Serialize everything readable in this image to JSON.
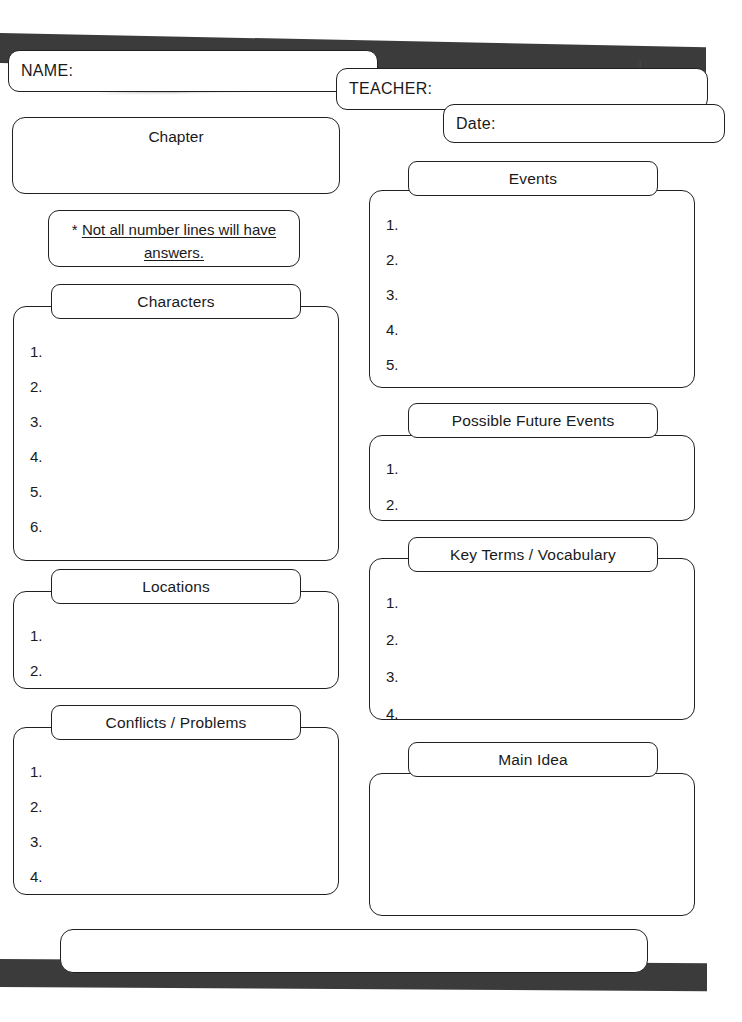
{
  "document": {
    "kind": "chapter-graphic-organizer-worksheet"
  },
  "header": {
    "name_label": "NAME:",
    "teacher_label": "TEACHER:",
    "date_label": "Date:"
  },
  "note": {
    "asterisk": "*",
    "line1": "Not all number lines will have",
    "line2": "answers."
  },
  "left_column": {
    "chapter": {
      "title": "Chapter",
      "items": []
    },
    "characters": {
      "title": "Characters",
      "items": [
        "1.",
        "2.",
        "3.",
        "4.",
        "5.",
        "6."
      ]
    },
    "locations": {
      "title": "Locations",
      "items": [
        "1.",
        "2."
      ]
    },
    "conflicts": {
      "title": "Conflicts / Problems",
      "items": [
        "1.",
        "2.",
        "3.",
        "4."
      ]
    }
  },
  "right_column": {
    "events": {
      "title": "Events",
      "items": [
        "1.",
        "2.",
        "3.",
        "4.",
        "5."
      ]
    },
    "future_events": {
      "title": "Possible Future Events",
      "items": [
        "1.",
        "2."
      ]
    },
    "key_terms": {
      "title": "Key Terms / Vocabulary",
      "items": [
        "1.",
        "2.",
        "3.",
        "4."
      ]
    },
    "main_idea": {
      "title": "Main Idea",
      "items": []
    }
  },
  "footer": {
    "box_text": ""
  },
  "colors": {
    "ink": "#231f20",
    "paper": "#ffffff",
    "scan_shadow": "#3b3b3b"
  }
}
